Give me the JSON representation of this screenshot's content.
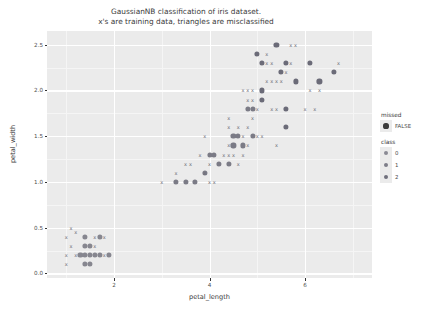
{
  "chart_data": {
    "type": "scatter",
    "title": "GaussianNB classification of iris dataset.",
    "subtitle": "x's are training data, triangles are misclassified",
    "xlabel": "petal_length",
    "ylabel": "petal_width",
    "xlim": [
      0.6,
      7.4
    ],
    "ylim": [
      -0.05,
      2.65
    ],
    "xticks": [
      "2",
      "4",
      "6"
    ],
    "xtick_values": [
      2,
      4,
      6
    ],
    "yticks": [
      "0.0",
      "0.5",
      "1.0",
      "1.5",
      "2.0",
      "2.5"
    ],
    "ytick_values": [
      0.0,
      0.5,
      1.0,
      1.5,
      2.0,
      2.5
    ],
    "grid": "major-white-on-gray",
    "legend_position": "right",
    "legends": [
      {
        "title": "missed",
        "entries": [
          {
            "label": "FALSE",
            "color": "#3b3b3b",
            "size": 5.2
          }
        ]
      },
      {
        "title": "class",
        "entries": [
          {
            "label": "0",
            "color": "#8a8a94",
            "size": 4.2
          },
          {
            "label": "1",
            "color": "#7d7d88",
            "size": 4.2
          },
          {
            "label": "2",
            "color": "#70707c",
            "size": 4.2
          }
        ]
      }
    ],
    "series": [
      {
        "name": "class 0 predicted (circles)",
        "marker": "circle",
        "color": "#86868f",
        "points": [
          [
            1.4,
            0.4
          ],
          [
            1.7,
            0.4
          ],
          [
            1.4,
            0.3
          ],
          [
            1.5,
            0.3
          ],
          [
            1.3,
            0.2
          ],
          [
            1.4,
            0.2
          ],
          [
            1.5,
            0.2
          ],
          [
            1.6,
            0.2
          ],
          [
            1.7,
            0.2
          ],
          [
            1.9,
            0.2
          ],
          [
            1.4,
            0.1
          ],
          [
            1.5,
            0.1
          ]
        ]
      },
      {
        "name": "class 1 predicted (circles)",
        "marker": "circle",
        "color": "#7b7b86",
        "points": [
          [
            3.3,
            1.0
          ],
          [
            3.5,
            1.0
          ],
          [
            3.7,
            1.0
          ],
          [
            3.9,
            1.1
          ],
          [
            4.2,
            1.2
          ],
          [
            4.4,
            1.2
          ],
          [
            4.0,
            1.3
          ],
          [
            4.1,
            1.3
          ],
          [
            4.5,
            1.4
          ],
          [
            4.7,
            1.4
          ],
          [
            4.5,
            1.5
          ],
          [
            4.6,
            1.5
          ],
          [
            4.9,
            1.5
          ],
          [
            4.8,
            1.8
          ],
          [
            4.9,
            1.8
          ]
        ]
      },
      {
        "name": "class 2 predicted (circles)",
        "marker": "circle",
        "color": "#6b6b78",
        "points": [
          [
            5.6,
            1.6
          ],
          [
            5.6,
            1.8
          ],
          [
            5.1,
            1.9
          ],
          [
            5.1,
            2.0
          ],
          [
            5.8,
            2.1
          ],
          [
            6.3,
            2.1
          ],
          [
            5.5,
            2.2
          ],
          [
            6.6,
            2.2
          ],
          [
            5.6,
            2.3
          ],
          [
            5.1,
            2.3
          ],
          [
            6.1,
            2.3
          ],
          [
            5.0,
            2.4
          ],
          [
            5.4,
            2.5
          ]
        ]
      },
      {
        "name": "training data (x marks)",
        "marker": "x",
        "color": "#6e6e78",
        "points": [
          [
            1.1,
            0.5
          ],
          [
            1.2,
            0.45
          ],
          [
            1.0,
            0.4
          ],
          [
            1.6,
            0.4
          ],
          [
            1.8,
            0.4
          ],
          [
            1.1,
            0.3
          ],
          [
            1.6,
            0.3
          ],
          [
            1.0,
            0.2
          ],
          [
            1.2,
            0.2
          ],
          [
            1.8,
            0.2
          ],
          [
            1.0,
            0.1
          ],
          [
            3.0,
            1.0
          ],
          [
            4.0,
            1.0
          ],
          [
            4.1,
            1.0
          ],
          [
            3.3,
            1.1
          ],
          [
            3.9,
            1.1
          ],
          [
            3.5,
            1.2
          ],
          [
            3.6,
            1.2
          ],
          [
            4.0,
            1.2
          ],
          [
            4.6,
            1.2
          ],
          [
            3.8,
            1.3
          ],
          [
            4.3,
            1.3
          ],
          [
            4.4,
            1.3
          ],
          [
            4.5,
            1.3
          ],
          [
            4.7,
            1.3
          ],
          [
            4.4,
            1.4
          ],
          [
            4.8,
            1.4
          ],
          [
            3.9,
            1.5
          ],
          [
            4.7,
            1.5
          ],
          [
            5.0,
            1.5
          ],
          [
            5.1,
            1.5
          ],
          [
            5.4,
            1.4
          ],
          [
            4.4,
            1.6
          ],
          [
            4.6,
            1.6
          ],
          [
            4.8,
            1.6
          ],
          [
            4.4,
            1.7
          ],
          [
            4.9,
            1.7
          ],
          [
            5.0,
            1.8
          ],
          [
            5.3,
            1.8
          ],
          [
            5.4,
            1.8
          ],
          [
            6.0,
            1.8
          ],
          [
            6.2,
            1.8
          ],
          [
            4.8,
            1.9
          ],
          [
            4.9,
            1.9
          ],
          [
            4.7,
            2.0
          ],
          [
            4.8,
            2.0
          ],
          [
            4.9,
            2.0
          ],
          [
            6.1,
            2.0
          ],
          [
            6.3,
            2.0
          ],
          [
            5.2,
            2.1
          ],
          [
            5.3,
            2.1
          ],
          [
            5.4,
            2.1
          ],
          [
            5.5,
            2.1
          ],
          [
            5.6,
            2.2
          ],
          [
            5.1,
            2.3
          ],
          [
            5.2,
            2.3
          ],
          [
            5.3,
            2.3
          ],
          [
            5.7,
            2.3
          ],
          [
            6.7,
            2.3
          ],
          [
            5.2,
            2.4
          ],
          [
            5.7,
            2.5
          ],
          [
            5.8,
            2.5
          ]
        ]
      }
    ]
  }
}
